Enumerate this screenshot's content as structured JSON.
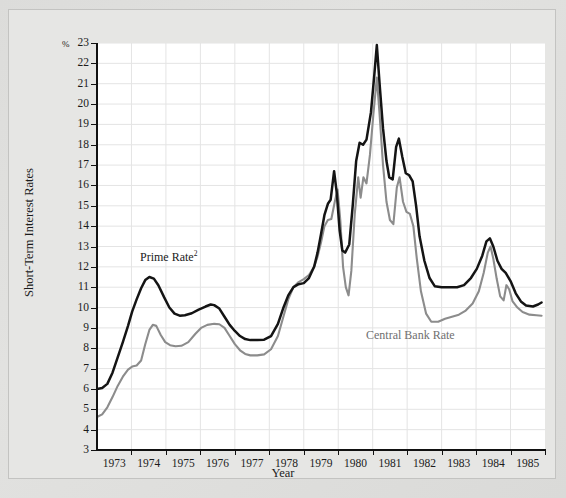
{
  "chart_data": {
    "type": "line",
    "title": "",
    "xlabel": "Year",
    "ylabel": "Short-Term Interest Rates",
    "y_unit": "%",
    "ylim": [
      3,
      23
    ],
    "xlim": [
      1972.6,
      1985.6
    ],
    "yticks": [
      23,
      22,
      21,
      20,
      19,
      18,
      17,
      16,
      15,
      14,
      13,
      12,
      11,
      10,
      9,
      8,
      7,
      6,
      5,
      4,
      3
    ],
    "xticks": [
      1973,
      1974,
      1975,
      1976,
      1977,
      1978,
      1979,
      1980,
      1981,
      1982,
      1983,
      1984,
      1985
    ],
    "grid": true,
    "legend_position": "inline-annotations",
    "series": [
      {
        "name": "Prime Rate",
        "label_text": "Prime Rate",
        "label_superscript": "2",
        "color": "#141414",
        "points": [
          [
            1972.6,
            6.0
          ],
          [
            1972.75,
            6.05
          ],
          [
            1972.9,
            6.25
          ],
          [
            1973.05,
            6.8
          ],
          [
            1973.2,
            7.55
          ],
          [
            1973.35,
            8.3
          ],
          [
            1973.5,
            9.1
          ],
          [
            1973.62,
            9.8
          ],
          [
            1973.75,
            10.4
          ],
          [
            1973.88,
            10.95
          ],
          [
            1974.0,
            11.35
          ],
          [
            1974.12,
            11.5
          ],
          [
            1974.25,
            11.42
          ],
          [
            1974.38,
            11.1
          ],
          [
            1974.55,
            10.5
          ],
          [
            1974.7,
            10.0
          ],
          [
            1974.85,
            9.7
          ],
          [
            1975.0,
            9.6
          ],
          [
            1975.15,
            9.62
          ],
          [
            1975.35,
            9.72
          ],
          [
            1975.55,
            9.9
          ],
          [
            1975.75,
            10.05
          ],
          [
            1975.9,
            10.15
          ],
          [
            1976.0,
            10.12
          ],
          [
            1976.15,
            9.95
          ],
          [
            1976.3,
            9.55
          ],
          [
            1976.45,
            9.15
          ],
          [
            1976.6,
            8.85
          ],
          [
            1976.75,
            8.6
          ],
          [
            1976.9,
            8.45
          ],
          [
            1977.05,
            8.4
          ],
          [
            1977.25,
            8.4
          ],
          [
            1977.45,
            8.42
          ],
          [
            1977.65,
            8.6
          ],
          [
            1977.85,
            9.2
          ],
          [
            1978.0,
            9.95
          ],
          [
            1978.15,
            10.6
          ],
          [
            1978.3,
            11.0
          ],
          [
            1978.45,
            11.15
          ],
          [
            1978.6,
            11.2
          ],
          [
            1978.75,
            11.45
          ],
          [
            1978.9,
            12.0
          ],
          [
            1979.0,
            12.7
          ],
          [
            1979.1,
            13.6
          ],
          [
            1979.2,
            14.55
          ],
          [
            1979.3,
            15.1
          ],
          [
            1979.38,
            15.3
          ],
          [
            1979.48,
            16.7
          ],
          [
            1979.56,
            15.6
          ],
          [
            1979.64,
            13.8
          ],
          [
            1979.72,
            12.8
          ],
          [
            1979.8,
            12.7
          ],
          [
            1979.92,
            13.1
          ],
          [
            1980.02,
            15.0
          ],
          [
            1980.12,
            17.2
          ],
          [
            1980.22,
            18.1
          ],
          [
            1980.32,
            18.0
          ],
          [
            1980.42,
            18.25
          ],
          [
            1980.55,
            19.6
          ],
          [
            1980.65,
            21.5
          ],
          [
            1980.72,
            22.9
          ],
          [
            1980.8,
            21.0
          ],
          [
            1980.9,
            18.8
          ],
          [
            1981.0,
            17.2
          ],
          [
            1981.08,
            16.4
          ],
          [
            1981.18,
            16.3
          ],
          [
            1981.28,
            17.9
          ],
          [
            1981.36,
            18.3
          ],
          [
            1981.46,
            17.4
          ],
          [
            1981.56,
            16.6
          ],
          [
            1981.66,
            16.5
          ],
          [
            1981.76,
            16.2
          ],
          [
            1981.86,
            15.0
          ],
          [
            1981.96,
            13.5
          ],
          [
            1982.1,
            12.3
          ],
          [
            1982.25,
            11.45
          ],
          [
            1982.4,
            11.05
          ],
          [
            1982.6,
            11.0
          ],
          [
            1982.85,
            11.0
          ],
          [
            1983.05,
            11.0
          ],
          [
            1983.25,
            11.1
          ],
          [
            1983.45,
            11.45
          ],
          [
            1983.62,
            11.9
          ],
          [
            1983.78,
            12.55
          ],
          [
            1983.9,
            13.25
          ],
          [
            1984.0,
            13.4
          ],
          [
            1984.1,
            13.0
          ],
          [
            1984.22,
            12.3
          ],
          [
            1984.34,
            11.9
          ],
          [
            1984.46,
            11.7
          ],
          [
            1984.6,
            11.3
          ],
          [
            1984.75,
            10.7
          ],
          [
            1984.9,
            10.3
          ],
          [
            1985.05,
            10.1
          ],
          [
            1985.25,
            10.05
          ],
          [
            1985.4,
            10.15
          ],
          [
            1985.5,
            10.25
          ]
        ]
      },
      {
        "name": "Central Bank Rate",
        "label_text": "Central Bank Rate",
        "label_superscript": "",
        "color": "#8c8c8c",
        "points": [
          [
            1972.6,
            4.62
          ],
          [
            1972.75,
            4.75
          ],
          [
            1972.9,
            5.1
          ],
          [
            1973.05,
            5.6
          ],
          [
            1973.2,
            6.15
          ],
          [
            1973.35,
            6.6
          ],
          [
            1973.5,
            6.95
          ],
          [
            1973.62,
            7.1
          ],
          [
            1973.75,
            7.15
          ],
          [
            1973.88,
            7.4
          ],
          [
            1974.0,
            8.2
          ],
          [
            1974.12,
            8.9
          ],
          [
            1974.22,
            9.15
          ],
          [
            1974.32,
            9.1
          ],
          [
            1974.45,
            8.65
          ],
          [
            1974.58,
            8.3
          ],
          [
            1974.72,
            8.15
          ],
          [
            1974.88,
            8.1
          ],
          [
            1975.05,
            8.12
          ],
          [
            1975.25,
            8.3
          ],
          [
            1975.45,
            8.7
          ],
          [
            1975.62,
            9.0
          ],
          [
            1975.8,
            9.15
          ],
          [
            1976.0,
            9.2
          ],
          [
            1976.15,
            9.18
          ],
          [
            1976.3,
            9.0
          ],
          [
            1976.45,
            8.6
          ],
          [
            1976.6,
            8.2
          ],
          [
            1976.75,
            7.9
          ],
          [
            1976.9,
            7.72
          ],
          [
            1977.05,
            7.65
          ],
          [
            1977.25,
            7.65
          ],
          [
            1977.45,
            7.7
          ],
          [
            1977.65,
            7.95
          ],
          [
            1977.85,
            8.6
          ],
          [
            1978.0,
            9.5
          ],
          [
            1978.15,
            10.4
          ],
          [
            1978.3,
            11.0
          ],
          [
            1978.45,
            11.25
          ],
          [
            1978.6,
            11.4
          ],
          [
            1978.75,
            11.6
          ],
          [
            1978.9,
            12.0
          ],
          [
            1979.0,
            12.5
          ],
          [
            1979.1,
            13.2
          ],
          [
            1979.2,
            14.0
          ],
          [
            1979.3,
            14.3
          ],
          [
            1979.4,
            14.35
          ],
          [
            1979.5,
            15.2
          ],
          [
            1979.58,
            15.8
          ],
          [
            1979.66,
            14.3
          ],
          [
            1979.74,
            12.0
          ],
          [
            1979.82,
            11.0
          ],
          [
            1979.9,
            10.6
          ],
          [
            1979.98,
            11.8
          ],
          [
            1980.08,
            14.6
          ],
          [
            1980.18,
            16.4
          ],
          [
            1980.25,
            15.4
          ],
          [
            1980.33,
            16.4
          ],
          [
            1980.42,
            16.1
          ],
          [
            1980.52,
            17.5
          ],
          [
            1980.62,
            19.5
          ],
          [
            1980.72,
            21.3
          ],
          [
            1980.8,
            19.5
          ],
          [
            1980.9,
            17.0
          ],
          [
            1981.0,
            15.2
          ],
          [
            1981.1,
            14.3
          ],
          [
            1981.2,
            14.1
          ],
          [
            1981.3,
            15.9
          ],
          [
            1981.38,
            16.4
          ],
          [
            1981.48,
            15.2
          ],
          [
            1981.58,
            14.7
          ],
          [
            1981.68,
            14.6
          ],
          [
            1981.78,
            14.0
          ],
          [
            1981.88,
            12.4
          ],
          [
            1982.0,
            10.8
          ],
          [
            1982.15,
            9.7
          ],
          [
            1982.3,
            9.3
          ],
          [
            1982.5,
            9.3
          ],
          [
            1982.7,
            9.45
          ],
          [
            1982.9,
            9.55
          ],
          [
            1983.1,
            9.65
          ],
          [
            1983.3,
            9.85
          ],
          [
            1983.5,
            10.2
          ],
          [
            1983.68,
            10.8
          ],
          [
            1983.82,
            11.7
          ],
          [
            1983.94,
            12.7
          ],
          [
            1984.02,
            13.0
          ],
          [
            1984.1,
            12.4
          ],
          [
            1984.2,
            11.4
          ],
          [
            1984.3,
            10.55
          ],
          [
            1984.4,
            10.35
          ],
          [
            1984.48,
            11.1
          ],
          [
            1984.56,
            10.9
          ],
          [
            1984.66,
            10.3
          ],
          [
            1984.8,
            10.0
          ],
          [
            1984.95,
            9.78
          ],
          [
            1985.15,
            9.65
          ],
          [
            1985.35,
            9.62
          ],
          [
            1985.5,
            9.6
          ]
        ]
      }
    ]
  },
  "axes": {
    "x_title": "Year",
    "y_title": "Short-Term Interest Rates",
    "y_unit_label": "%"
  }
}
